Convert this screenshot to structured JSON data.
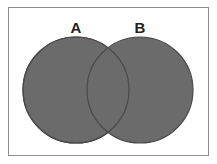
{
  "diagram": {
    "type": "venn",
    "sets": [
      {
        "label": "A",
        "cx": 76,
        "cy": 90,
        "r": 53
      },
      {
        "label": "B",
        "cx": 140,
        "cy": 90,
        "r": 53
      }
    ],
    "colors": {
      "fill": "#6b6b6b",
      "stroke": "#4a4a4a",
      "frame": "#8c8c8c",
      "background": "#ffffff",
      "label": "#222222"
    }
  }
}
